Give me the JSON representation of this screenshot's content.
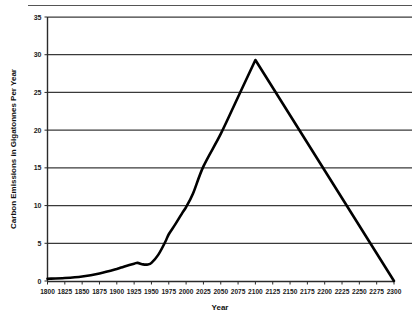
{
  "chart_data": {
    "type": "line",
    "title": "",
    "xlabel": "Year",
    "ylabel": "Carbon Emissions in Gigatonnes Per Year",
    "xlim": [
      1800,
      2300
    ],
    "ylim": [
      0,
      35
    ],
    "grid": true,
    "legend": "none",
    "xticks": [
      1800,
      1825,
      1850,
      1875,
      1900,
      1925,
      1950,
      1975,
      2000,
      2025,
      2050,
      2075,
      2100,
      2125,
      2150,
      2175,
      2200,
      2225,
      2250,
      2275,
      2300
    ],
    "yticks": [
      0,
      5,
      10,
      15,
      20,
      25,
      30,
      35
    ],
    "line_color": "#000000",
    "series": [
      {
        "name": "Carbon Emissions",
        "x": [
          1800,
          1825,
          1850,
          1875,
          1900,
          1910,
          1925,
          1930,
          1938,
          1945,
          1950,
          1960,
          1970,
          1975,
          1985,
          1995,
          2000,
          2010,
          2025,
          2050,
          2075,
          2100,
          2300
        ],
        "values": [
          0.3,
          0.4,
          0.6,
          1.0,
          1.6,
          1.9,
          2.3,
          2.4,
          2.2,
          2.2,
          2.4,
          3.5,
          5.2,
          6.2,
          7.6,
          9.1,
          9.8,
          11.6,
          15.2,
          19.5,
          24.4,
          29.3,
          0.0
        ]
      }
    ],
    "annotations": []
  },
  "axis_titles": {
    "x": "Year",
    "y": "Carbon Emissions in Gigatonnes Per Year"
  },
  "ytick_labels": [
    "0",
    "5",
    "10",
    "15",
    "20",
    "25",
    "30",
    "35"
  ],
  "xtick_labels": [
    "1800",
    "1825",
    "1850",
    "1875",
    "1900",
    "1925",
    "1950",
    "1975",
    "2000",
    "2025",
    "2050",
    "2075",
    "2100",
    "2125",
    "2150",
    "2175",
    "2200",
    "2225",
    "2250",
    "2275",
    "2300"
  ]
}
